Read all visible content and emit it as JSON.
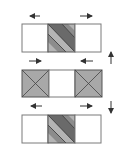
{
  "diagram": {
    "title": "",
    "rows": [
      {
        "id": "row-1",
        "cells": [
          "blank",
          "diagonal-stripes",
          "blank"
        ],
        "arrows": {
          "left": "left",
          "right": "right"
        }
      },
      {
        "id": "row-2",
        "cells": [
          "x-cross",
          "blank",
          "x-cross"
        ],
        "arrows": {
          "left": "right",
          "right": "left"
        }
      },
      {
        "id": "row-3",
        "cells": [
          "blank",
          "diagonal-stripes",
          "blank"
        ],
        "arrows": {
          "left": "left",
          "right": "right"
        }
      }
    ],
    "side_arrows": [
      {
        "id": "up-arrow",
        "direction": "up"
      },
      {
        "id": "down-arrow",
        "direction": "down"
      }
    ],
    "colors": {
      "outline": "#7a7a7a",
      "cross_fill": "#a8a8a8",
      "stripe_dark": "#6a6a6a",
      "stripe_mid": "#8c8c8c",
      "stripe_light": "#b4b4b4",
      "arrow": "#333333"
    }
  }
}
